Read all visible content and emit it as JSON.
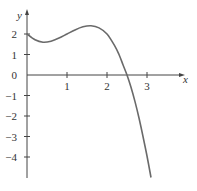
{
  "chart_data": {
    "type": "line",
    "title": "",
    "xlabel": "x",
    "ylabel": "y",
    "xlim": [
      0,
      3.9
    ],
    "ylim": [
      -5,
      2.8
    ],
    "grid": false,
    "x_ticks": [
      1,
      2,
      3
    ],
    "x_tick_labels": [
      "1",
      "2",
      "3"
    ],
    "y_ticks": [
      2,
      1,
      0,
      -1,
      -2,
      -3,
      -4
    ],
    "y_tick_labels": [
      "2",
      "1",
      "0",
      "−1",
      "−2",
      "−3",
      "−4"
    ],
    "series": [
      {
        "name": "f(x)",
        "color": "#6a6a6a",
        "x": [
          0,
          0.2,
          0.4,
          0.6,
          0.8,
          1.0,
          1.2,
          1.4,
          1.6,
          1.8,
          2.0,
          2.2,
          2.3,
          2.4,
          2.5,
          2.6,
          2.7,
          2.8,
          2.9,
          3.0,
          3.1
        ],
        "y": [
          2.0,
          1.72,
          1.6,
          1.65,
          1.8,
          2.0,
          2.2,
          2.35,
          2.4,
          2.3,
          2.0,
          1.4,
          1.0,
          0.5,
          0.0,
          -0.6,
          -1.3,
          -2.1,
          -3.0,
          -3.95,
          -5.0
        ]
      }
    ]
  }
}
